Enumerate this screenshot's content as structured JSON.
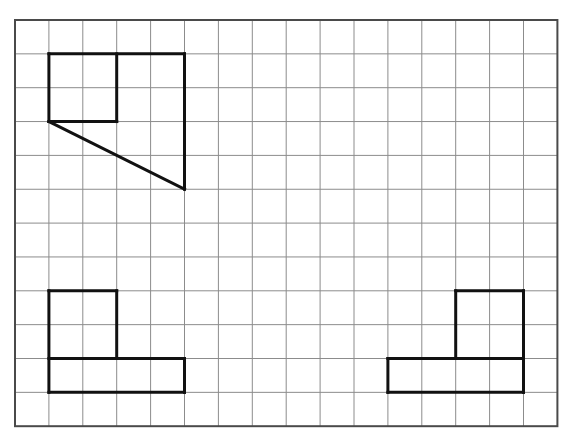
{
  "diagram": {
    "type": "grid-drawing",
    "grid": {
      "cols": 16,
      "rows": 12,
      "origin_x": 15,
      "origin_y": 20,
      "cell_w": 33.9,
      "cell_h": 33.85,
      "line_color": "#8c8c8c",
      "line_width": 1,
      "border_color": "#4a4a4a",
      "border_width": 2
    },
    "shape_style": {
      "stroke": "#111111",
      "stroke_width": 3
    },
    "shapes": [
      {
        "id": "top-left-figure",
        "description": "Rectangle with inner square and diagonal cut",
        "segments": [
          [
            [
              1,
              1
            ],
            [
              5,
              1
            ]
          ],
          [
            [
              5,
              1
            ],
            [
              5,
              5
            ]
          ],
          [
            [
              5,
              5
            ],
            [
              1,
              3
            ]
          ],
          [
            [
              1,
              3
            ],
            [
              1,
              1
            ]
          ],
          [
            [
              3,
              1
            ],
            [
              3,
              3
            ]
          ],
          [
            [
              1,
              3
            ],
            [
              3,
              3
            ]
          ]
        ]
      },
      {
        "id": "bottom-left-figure",
        "description": "L-shape: 2x2 square on top-left of a 4x1 bar",
        "segments": [
          [
            [
              1,
              8
            ],
            [
              3,
              8
            ]
          ],
          [
            [
              3,
              8
            ],
            [
              3,
              10
            ]
          ],
          [
            [
              1,
              8
            ],
            [
              1,
              11
            ]
          ],
          [
            [
              1,
              10
            ],
            [
              5,
              10
            ]
          ],
          [
            [
              5,
              10
            ],
            [
              5,
              11
            ]
          ],
          [
            [
              1,
              11
            ],
            [
              5,
              11
            ]
          ]
        ]
      },
      {
        "id": "bottom-right-figure",
        "description": "Mirrored L-shape: 2x2 square on top-right of a 4x1 bar",
        "segments": [
          [
            [
              13,
              8
            ],
            [
              15,
              8
            ]
          ],
          [
            [
              13,
              8
            ],
            [
              13,
              10
            ]
          ],
          [
            [
              15,
              8
            ],
            [
              15,
              11
            ]
          ],
          [
            [
              11,
              10
            ],
            [
              15,
              10
            ]
          ],
          [
            [
              11,
              10
            ],
            [
              11,
              11
            ]
          ],
          [
            [
              11,
              11
            ],
            [
              15,
              11
            ]
          ]
        ]
      }
    ]
  }
}
